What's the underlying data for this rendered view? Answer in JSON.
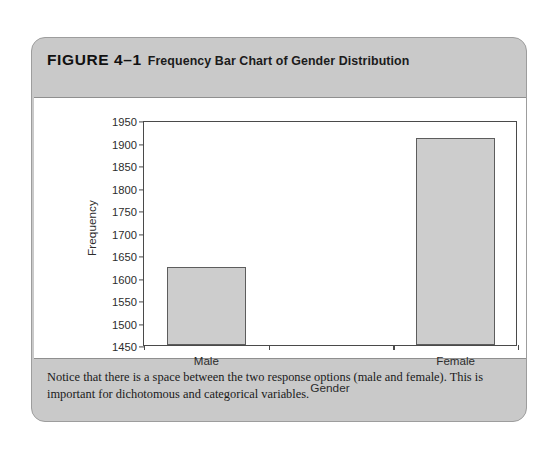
{
  "figure": {
    "number": "FIGURE 4–1",
    "title": "Frequency Bar Chart of Gender Distribution",
    "caption": "Notice that there is a space between the two response options (male and female). This is important for dichotomous and categorical variables."
  },
  "colors": {
    "box_background": "#c9c9c9",
    "panel_background": "#ffffff",
    "bar_fill": "#cdcdcd",
    "bar_stroke": "#5d5d5d",
    "axis": "#4a4a4a"
  },
  "chart_data": {
    "type": "bar",
    "title": "Frequency Bar Chart of Gender Distribution",
    "categories": [
      "Male",
      "Female"
    ],
    "values": [
      1623,
      1910
    ],
    "xlabel": "Gender",
    "ylabel": "Frequency",
    "ylim": [
      1450,
      1950
    ],
    "ytick_step": 50,
    "yticks": [
      1450,
      1500,
      1550,
      1600,
      1650,
      1700,
      1750,
      1800,
      1850,
      1900,
      1950
    ],
    "ytick_labels": [
      "1450",
      "1500",
      "1550",
      "1600",
      "1650",
      "1700",
      "1750",
      "1800",
      "1850",
      "1900",
      "1950"
    ],
    "grid": false,
    "legend": false,
    "bar_gap_note": "space between the two response options"
  }
}
